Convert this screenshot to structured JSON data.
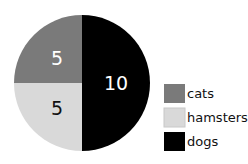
{
  "chart_data": {
    "type": "pie",
    "title": "",
    "categories": [
      "cats",
      "hamsters",
      "dogs"
    ],
    "values": [
      5,
      5,
      10
    ],
    "colors": [
      "#7a7a7a",
      "#d9d9d9",
      "#000000"
    ],
    "label_colors": [
      "#ffffff",
      "#111111",
      "#ffffff"
    ],
    "slice_labels": [
      "5",
      "5",
      "10"
    ],
    "legend_position": "right",
    "start_angle_deg": 0,
    "direction": "counterclockwise-from-top",
    "layout": {
      "cx": 82,
      "cy": 83,
      "r": 68,
      "legend_x": 164,
      "legend_y": [
        84,
        108,
        132
      ],
      "swatch_w": 21,
      "swatch_h": 19
    }
  }
}
